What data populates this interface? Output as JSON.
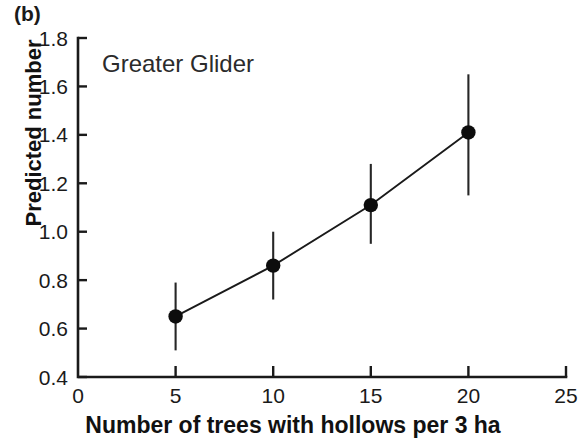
{
  "figure": {
    "panel_label": "(b)",
    "annotation": "Greater Glider"
  },
  "chart_data": {
    "type": "line",
    "title": "",
    "subtitle": "",
    "annotations": [
      "(b)",
      "Greater Glider"
    ],
    "xlabel": "Number of trees with hollows per 3 ha",
    "ylabel": "Predicted number",
    "xlim": [
      0,
      25
    ],
    "ylim": [
      0.4,
      1.8
    ],
    "xticks": [
      0,
      5,
      10,
      15,
      20,
      25
    ],
    "xtick_labels": [
      "0",
      "5",
      "10",
      "15",
      "20",
      "25"
    ],
    "yticks": [
      0.4,
      0.6,
      0.8,
      1.0,
      1.2,
      1.4,
      1.6,
      1.8
    ],
    "ytick_labels": [
      "0.4",
      "0.6",
      "0.8",
      "1.0",
      "1.2",
      "1.4",
      "1.6",
      "1.8"
    ],
    "grid": false,
    "legend": "none",
    "marker": "filled-circle",
    "error_bars": "vertical",
    "x": [
      5,
      10,
      15,
      20
    ],
    "values": [
      0.65,
      0.86,
      1.11,
      1.41
    ],
    "err_low": [
      0.51,
      0.72,
      0.95,
      1.15
    ],
    "err_high": [
      0.79,
      1.0,
      1.28,
      1.65
    ],
    "series": [
      {
        "name": "Greater Glider",
        "x": [
          5,
          10,
          15,
          20
        ],
        "values": [
          0.65,
          0.86,
          1.11,
          1.41
        ],
        "err_low": [
          0.51,
          0.72,
          0.95,
          1.15
        ],
        "err_high": [
          0.79,
          1.0,
          1.28,
          1.65
        ]
      }
    ],
    "colors": {
      "marker": "#0d0d0d",
      "line": "#1a1a1a",
      "axis": "#1a1a1a",
      "error_bar": "#262626"
    }
  }
}
